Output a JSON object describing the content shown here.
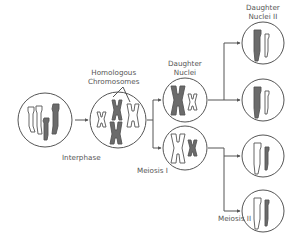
{
  "title": "Meiosis",
  "labels": {
    "homologous": [
      "Homologous",
      "Chromosomes"
    ],
    "daughter_nuclei": [
      "Daughter",
      "Nuclei"
    ],
    "daughter_nuclei_ii": [
      "Daughter",
      "Nuclei II"
    ],
    "interphase": "Interphase",
    "meiosis_i": "Meiosis I",
    "meiosis_ii": "Meiosis II"
  },
  "colors": {
    "outline": "#555555",
    "dark_chromosome": "#6b6b6b",
    "light_chromosome": "#ffffff",
    "arrow": "#555555",
    "text": "#555555"
  },
  "stages": [
    {
      "name": "interphase-cell",
      "cx": 45,
      "cy": 120,
      "r": 27
    },
    {
      "name": "homologous-cell",
      "cx": 118,
      "cy": 120,
      "r": 28
    },
    {
      "name": "daughter-nucleus-1",
      "cx": 185,
      "cy": 100,
      "r": 22
    },
    {
      "name": "daughter-nucleus-2",
      "cx": 185,
      "cy": 148,
      "r": 22
    },
    {
      "name": "daughter-nucleus-ii-1",
      "cx": 263,
      "cy": 43,
      "r": 21
    },
    {
      "name": "daughter-nucleus-ii-2",
      "cx": 263,
      "cy": 100,
      "r": 21
    },
    {
      "name": "daughter-nucleus-ii-3",
      "cx": 263,
      "cy": 156,
      "r": 21
    },
    {
      "name": "daughter-nucleus-ii-4",
      "cx": 263,
      "cy": 211,
      "r": 21
    }
  ]
}
